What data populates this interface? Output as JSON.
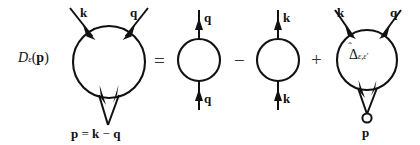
{
  "figure": {
    "type": "feynman-diagram-equation",
    "background_color": "#ffffff",
    "line_color": "#111111"
  },
  "lhs": {
    "label_D": "D",
    "label_eps": "ε",
    "label_open_paren": "(",
    "label_p": "p",
    "label_close_paren": ")"
  },
  "operators": {
    "equals": "=",
    "minus": "−",
    "plus": "+"
  },
  "diagram1": {
    "name": "full-vertex-loop",
    "top_left_label": "k",
    "top_right_label": "q",
    "bottom_label_p": "p",
    "bottom_label_eq": "=",
    "bottom_label_k": "k",
    "bottom_label_minus": "−",
    "bottom_label_q": "q"
  },
  "diagram2": {
    "name": "q-bubble-loop",
    "top_label": "q",
    "bottom_label": "q"
  },
  "diagram3": {
    "name": "k-bubble-loop",
    "top_label": "k",
    "bottom_label": "k"
  },
  "diagram4": {
    "name": "delta-vertex-loop",
    "top_left_label": "k",
    "top_right_label": "q",
    "inner_label_delta": "Δ",
    "inner_label_sub": "ε,ε′",
    "bottom_label_p": "p"
  }
}
